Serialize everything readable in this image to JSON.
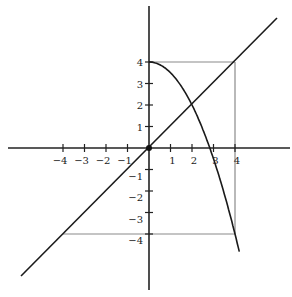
{
  "diagram": {
    "type": "coordinate-plane",
    "origin_px": [
      149,
      148
    ],
    "unit_px": 21.5,
    "x_ticks": [
      -4,
      -3,
      -2,
      -1,
      1,
      2,
      3,
      4
    ],
    "y_ticks": [
      -4,
      -3,
      -2,
      -1,
      1,
      2,
      3,
      4
    ],
    "x_tick_labels": [
      "−4",
      "−3",
      "−2",
      "−1",
      "1",
      "2",
      "3",
      "4"
    ],
    "y_tick_labels": [
      "−4",
      "−3",
      "−2",
      "−1",
      "1",
      "2",
      "3",
      "4"
    ],
    "curves": [
      {
        "name": "line y = x",
        "kind": "line",
        "color": "#1a1a1a"
      },
      {
        "name": "parabola y = 4 - x^2/2 (x>=0)",
        "kind": "parabola",
        "color": "#1a1a1a"
      }
    ],
    "guides": [
      {
        "name": "square top-right corner (4,4)",
        "color": "#888888"
      },
      {
        "name": "bottom guide y = -4",
        "color": "#888888"
      }
    ],
    "points": [
      {
        "name": "origin",
        "x": 0,
        "y": 0
      },
      {
        "name": "intersection",
        "x": 2,
        "y": 2
      }
    ]
  }
}
